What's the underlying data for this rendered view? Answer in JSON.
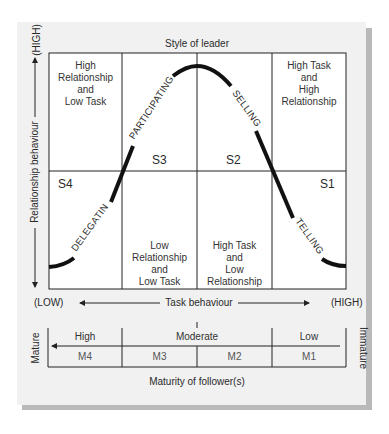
{
  "title": "Style of leader",
  "axes": {
    "y_label": "Relationship behaviour",
    "y_high": "(HIGH)",
    "x_label": "Task behaviour",
    "x_low": "(LOW)",
    "x_high": "(HIGH)"
  },
  "quadrants": {
    "top_left": [
      "High",
      "Relationship",
      "and",
      "Low Task"
    ],
    "top_right": [
      "High Task",
      "and",
      "High",
      "Relationship"
    ],
    "bottom_mid_left": [
      "Low",
      "Relationship",
      "and",
      "Low Task"
    ],
    "bottom_mid_right": [
      "High Task",
      "and",
      "Low",
      "Relationship"
    ]
  },
  "styles": [
    {
      "code": "S4",
      "name": "DELEGATING"
    },
    {
      "code": "S3",
      "name": "PARTICIPATING"
    },
    {
      "code": "S2",
      "name": "SELLING"
    },
    {
      "code": "S1",
      "name": "TELLING"
    }
  ],
  "maturity": {
    "levels": [
      "High",
      "Moderate",
      "Low"
    ],
    "codes": [
      "M4",
      "M3",
      "M2",
      "M1"
    ],
    "left_label": "Mature",
    "right_label": "Immature",
    "caption": "Maturity of follower(s)"
  },
  "colors": {
    "panel": "#f1f1f1",
    "grid_bg": "#ffffff",
    "line": "#222222",
    "shadow": "#b9b9b9"
  }
}
